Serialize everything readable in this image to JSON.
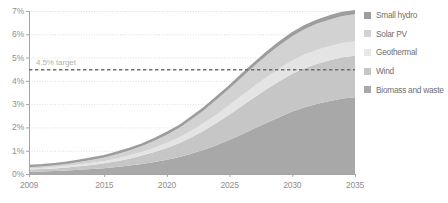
{
  "chart_data": {
    "type": "area",
    "stacked": true,
    "title": "",
    "xlabel": "",
    "ylabel": "",
    "x": [
      2009,
      2010,
      2011,
      2012,
      2013,
      2014,
      2015,
      2016,
      2017,
      2018,
      2019,
      2020,
      2021,
      2022,
      2023,
      2024,
      2025,
      2026,
      2027,
      2028,
      2029,
      2030,
      2031,
      2032,
      2033,
      2034,
      2035
    ],
    "xlim": [
      2009,
      2035
    ],
    "ylim": [
      0,
      7
    ],
    "y_tick_labels": [
      "0%",
      "1%",
      "2%",
      "3%",
      "4%",
      "5%",
      "6%",
      "7%"
    ],
    "y_tick_values": [
      0,
      1,
      2,
      3,
      4,
      5,
      6,
      7
    ],
    "x_tick_labels": [
      "2009",
      "2015",
      "2020",
      "2025",
      "2030",
      "2035"
    ],
    "x_tick_values": [
      2009,
      2015,
      2020,
      2025,
      2030,
      2035
    ],
    "grid": true,
    "legend_position": "right",
    "series": [
      {
        "name": "Biomass and waste",
        "color": "#a8a8a8",
        "values": [
          0.1,
          0.11,
          0.13,
          0.15,
          0.18,
          0.21,
          0.25,
          0.3,
          0.36,
          0.43,
          0.51,
          0.61,
          0.73,
          0.88,
          1.05,
          1.25,
          1.47,
          1.71,
          1.96,
          2.21,
          2.45,
          2.68,
          2.87,
          3.02,
          3.14,
          3.24,
          3.3
        ]
      },
      {
        "name": "Wind",
        "color": "#c6c6c6",
        "values": [
          0.09,
          0.1,
          0.11,
          0.13,
          0.15,
          0.18,
          0.21,
          0.25,
          0.3,
          0.36,
          0.43,
          0.51,
          0.6,
          0.71,
          0.83,
          0.96,
          1.09,
          1.22,
          1.34,
          1.45,
          1.54,
          1.62,
          1.68,
          1.72,
          1.75,
          1.77,
          1.78
        ]
      },
      {
        "name": "Geothermal",
        "color": "#e4e4e4",
        "values": [
          0.05,
          0.05,
          0.06,
          0.07,
          0.08,
          0.09,
          0.1,
          0.12,
          0.14,
          0.16,
          0.19,
          0.22,
          0.25,
          0.29,
          0.33,
          0.37,
          0.41,
          0.45,
          0.49,
          0.52,
          0.55,
          0.57,
          0.59,
          0.6,
          0.61,
          0.62,
          0.62
        ]
      },
      {
        "name": "Solar PV",
        "color": "#d2d2d2",
        "values": [
          0.06,
          0.07,
          0.08,
          0.09,
          0.11,
          0.13,
          0.15,
          0.18,
          0.21,
          0.25,
          0.3,
          0.35,
          0.41,
          0.48,
          0.55,
          0.63,
          0.71,
          0.79,
          0.87,
          0.94,
          1.0,
          1.05,
          1.09,
          1.12,
          1.14,
          1.15,
          1.16
        ]
      },
      {
        "name": "Small hydro",
        "color": "#9d9d9d",
        "values": [
          0.05,
          0.05,
          0.05,
          0.05,
          0.06,
          0.06,
          0.06,
          0.07,
          0.07,
          0.07,
          0.08,
          0.08,
          0.08,
          0.09,
          0.09,
          0.1,
          0.1,
          0.11,
          0.11,
          0.12,
          0.12,
          0.13,
          0.13,
          0.13,
          0.14,
          0.14,
          0.14
        ]
      }
    ],
    "annotations": [
      {
        "name": "target-line",
        "label": "4.5% target",
        "value": 4.5,
        "style": "dashed-horizontal",
        "color": "#6e6e6e"
      }
    ]
  },
  "legend": {
    "items": [
      {
        "label": "Small hydro",
        "color": "#9d9d9d"
      },
      {
        "label": "Solar PV",
        "color": "#d2d2d2"
      },
      {
        "label": "Geothermal",
        "color": "#e8e8e8"
      },
      {
        "label": "Wind",
        "color": "#c6c6c6"
      },
      {
        "label": "Biomass and waste",
        "color": "#a8a8a8"
      }
    ]
  },
  "axes": {
    "y_labels": [
      "7%",
      "6%",
      "5%",
      "4%",
      "3%",
      "2%",
      "1%",
      "0%"
    ],
    "x_labels": [
      "2009",
      "2015",
      "2020",
      "2025",
      "2030",
      "2035"
    ]
  },
  "target_note": "4.5% target"
}
